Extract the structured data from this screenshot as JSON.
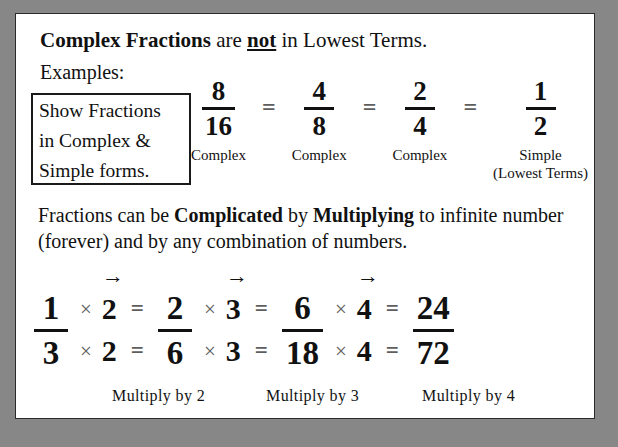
{
  "slide": {
    "frame_color": "#878787",
    "page_color": "#ffffff",
    "text_color": "#111111",
    "muted_symbol_color": "#5e5e5e"
  },
  "heading": {
    "part1_bold": "Complex Fractions",
    "part2": " are ",
    "part3_bold_underline": "not",
    "part4": " in Lowest Terms."
  },
  "examples": {
    "label": "Examples:",
    "note_box": {
      "line1": "Show Fractions",
      "line2": "in Complex &",
      "line3": "Simple forms."
    }
  },
  "equivalence_chain": {
    "equals_symbol": "=",
    "items": [
      {
        "numerator": "8",
        "denominator": "16",
        "caption": "Complex",
        "subcaption": ""
      },
      {
        "numerator": "4",
        "denominator": "8",
        "caption": "Complex",
        "subcaption": ""
      },
      {
        "numerator": "2",
        "denominator": "4",
        "caption": "Complex",
        "subcaption": ""
      },
      {
        "numerator": "1",
        "denominator": "2",
        "caption": "Simple",
        "subcaption": "(Lowest Terms)"
      }
    ]
  },
  "paragraph": {
    "part1": "Fractions can be ",
    "part2_bold": "Complicated",
    "part3": " by ",
    "part4_bold": "Multiplying",
    "part5": " to infinite number (forever) and by any combination of numbers."
  },
  "multiply_chain": {
    "arrow_symbol": "→",
    "times_symbol": "×",
    "equals_symbol": "=",
    "start_fraction": {
      "numerator": "1",
      "denominator": "3"
    },
    "steps": [
      {
        "factor": "2",
        "result": {
          "numerator": "2",
          "denominator": "6"
        },
        "caption": "Multiply by 2"
      },
      {
        "factor": "3",
        "result": {
          "numerator": "6",
          "denominator": "18"
        },
        "caption": "Multiply by 3"
      },
      {
        "factor": "4",
        "result": {
          "numerator": "24",
          "denominator": "72"
        },
        "caption": "Multiply by 4"
      }
    ]
  }
}
